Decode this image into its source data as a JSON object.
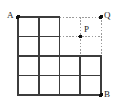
{
  "figure": {
    "kind": "geometry-grid-diagram",
    "canvas": {
      "width": 125,
      "height": 112
    },
    "background_color": "#ffffff",
    "solid_line_color": "#3c3c3c",
    "dotted_line_color": "#9a9a9a",
    "point_color": "#111111",
    "label_color": "#1a1a1a",
    "solid_stroke_width": 1.6,
    "dotted_stroke_width": 1.0,
    "dash_pattern": "1.6 1.6",
    "point_radius": 2.0
  },
  "grid": {
    "columns": 4,
    "rows": 4,
    "cell_width": 20.75,
    "cell_height": 19.5,
    "x_lines": [
      18,
      38.75,
      59.5,
      80.25,
      101
    ],
    "y_lines": [
      17,
      36.5,
      56,
      75.5,
      95
    ],
    "filled_cells_per_row": [
      2,
      2,
      4,
      4
    ],
    "total_filled_cells": 12
  },
  "points": [
    {
      "id": "A",
      "label": "A",
      "x": 18,
      "y": 17,
      "label_dx": -11,
      "label_dy": -6,
      "marker": true
    },
    {
      "id": "Q",
      "label": "Q",
      "x": 101,
      "y": 17,
      "label_dx": 3,
      "label_dy": -6,
      "marker": true
    },
    {
      "id": "P",
      "label": "P",
      "x": 80.25,
      "y": 36.5,
      "label_dx": 4,
      "label_dy": -11,
      "marker": true
    },
    {
      "id": "B",
      "label": "B",
      "x": 101,
      "y": 95,
      "label_dx": 3,
      "label_dy": -5,
      "marker": true
    }
  ],
  "solid_paths": {
    "outline": "M 18 17 L 59.5 17 L 59.5 56 L 80.25 56 L 80.25 56 L 101 56 L 101 95 L 18 95 Z",
    "interior_vertical_segments": [
      {
        "x": 38.75,
        "y1": 17,
        "y2": 95
      },
      {
        "x": 59.5,
        "y1": 17,
        "y2": 95
      },
      {
        "x": 80.25,
        "y1": 56,
        "y2": 95
      }
    ],
    "interior_horizontal_segments": [
      {
        "y": 36.5,
        "x1": 18,
        "x2": 59.5
      },
      {
        "y": 56,
        "x1": 18,
        "x2": 101
      },
      {
        "y": 75.5,
        "x1": 18,
        "x2": 101
      }
    ]
  },
  "dotted_paths": {
    "horizontal_segments": [
      {
        "y": 17,
        "x1": 59.5,
        "x2": 101,
        "name": "top-edge-to-Q"
      },
      {
        "y": 36.5,
        "x1": 59.5,
        "x2": 101,
        "name": "row2-line-through-P"
      }
    ],
    "vertical_segments": [
      {
        "x": 80.25,
        "y1": 17,
        "y2": 56,
        "name": "column-through-P"
      },
      {
        "x": 101,
        "y1": 17,
        "y2": 56,
        "name": "right-edge-below-Q"
      }
    ]
  }
}
